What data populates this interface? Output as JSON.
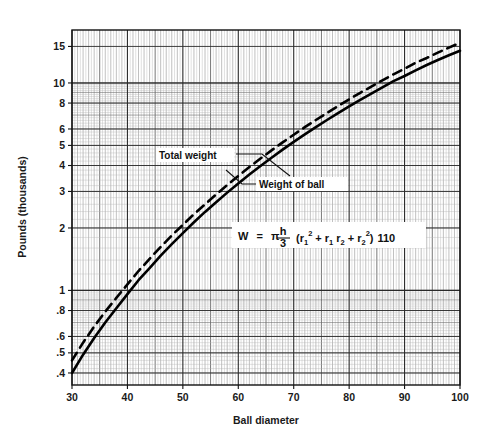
{
  "chart_data": {
    "type": "line",
    "title": "",
    "xlabel": "Ball diameter",
    "ylabel": "Pounds (thousands)",
    "yscale": "log",
    "xscale": "linear",
    "xlim": [
      30,
      100
    ],
    "ylim": [
      0.35,
      18
    ],
    "xticks": [
      30,
      40,
      50,
      60,
      70,
      80,
      90,
      100
    ],
    "xtick_labels": [
      "30",
      "40",
      "50",
      "60",
      "70",
      "80",
      "90",
      "100"
    ],
    "yticks": [
      0.4,
      0.5,
      0.6,
      0.8,
      1,
      2,
      3,
      4,
      5,
      6,
      8,
      10,
      15
    ],
    "ytick_labels": [
      ".4",
      ".5",
      ".6",
      ".8",
      "1",
      "2",
      "3",
      "4",
      "5",
      "6",
      "8",
      "10",
      "15"
    ],
    "grid": "semi-log graph paper, minor log divisions",
    "legend_position": "inline annotations",
    "annotations": [
      {
        "name": "total-weight",
        "text": "Total weight",
        "x": 57,
        "y": 4.6
      },
      {
        "name": "weight-of-ball",
        "text": "Weight of ball",
        "x": 72,
        "y": 3.3
      },
      {
        "name": "formula",
        "text": "W = π h/3 (r₁² + r₁ r₂ + r₂²) 110",
        "x": 75,
        "y": 1.85
      }
    ],
    "series": [
      {
        "name": "Weight of ball",
        "style": "solid",
        "color": "#000000",
        "x": [
          30,
          32,
          34,
          36,
          38,
          40,
          42,
          44,
          46,
          48,
          50,
          52,
          54,
          56,
          58,
          60,
          62,
          64,
          66,
          68,
          70,
          72,
          74,
          76,
          78,
          80,
          82,
          84,
          86,
          88,
          90,
          92,
          94,
          96,
          98,
          100
        ],
        "values": [
          0.4,
          0.49,
          0.59,
          0.7,
          0.82,
          0.96,
          1.12,
          1.28,
          1.47,
          1.67,
          1.89,
          2.13,
          2.39,
          2.66,
          2.96,
          3.28,
          3.62,
          3.98,
          4.36,
          4.77,
          5.2,
          5.65,
          6.13,
          6.63,
          7.16,
          7.71,
          8.29,
          8.89,
          9.52,
          10.2,
          10.8,
          11.5,
          12.2,
          12.9,
          13.6,
          14.3
        ]
      },
      {
        "name": "Total weight",
        "style": "dashed",
        "color": "#000000",
        "x": [
          30,
          32,
          34,
          36,
          38,
          40,
          42,
          44,
          46,
          48,
          50,
          52,
          54,
          56,
          58,
          60,
          62,
          64,
          66,
          68,
          70,
          72,
          74,
          76,
          78,
          80,
          82,
          84,
          86,
          88,
          90,
          92,
          94,
          96,
          98,
          100
        ],
        "values": [
          0.46,
          0.56,
          0.67,
          0.79,
          0.92,
          1.07,
          1.24,
          1.42,
          1.62,
          1.84,
          2.07,
          2.33,
          2.6,
          2.9,
          3.22,
          3.56,
          3.93,
          4.32,
          4.73,
          5.17,
          5.63,
          6.12,
          6.63,
          7.17,
          7.74,
          8.34,
          8.96,
          9.61,
          10.3,
          11.0,
          11.7,
          12.5,
          13.2,
          14.0,
          14.8,
          15.6
        ]
      }
    ]
  },
  "formula": {
    "w": "W",
    "equals": "=",
    "pi": "π",
    "num": "h",
    "den": "3",
    "open": "(r",
    "sub1": "1",
    "sup1": "2",
    "plus1": "+ r",
    "sub2": "1",
    "r2": "r",
    "sub3": "2",
    "plus2": "+ r",
    "sub4": "2",
    "sup2": "2",
    "close": ")",
    "factor": "110"
  },
  "axes": {
    "x_title": "Ball diameter",
    "y_title": "Pounds (thousands)"
  }
}
